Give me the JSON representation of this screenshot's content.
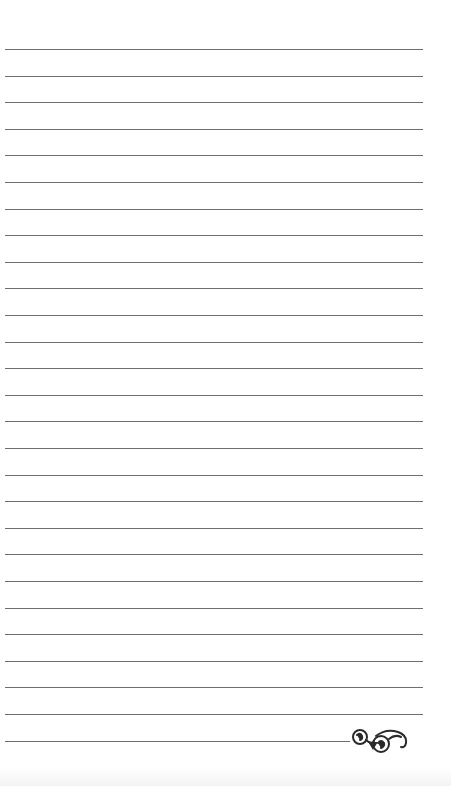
{
  "page": {
    "type": "lined-notepaper",
    "background_color": "#ffffff",
    "line_color": "#6e6e6e",
    "line_count": 27,
    "first_line_y": 49,
    "line_spacing": 26.6,
    "line_left": 5,
    "line_width": 418
  },
  "ornament": {
    "icon": "flourish-swirl-icon",
    "color": "#2a2a2a"
  }
}
